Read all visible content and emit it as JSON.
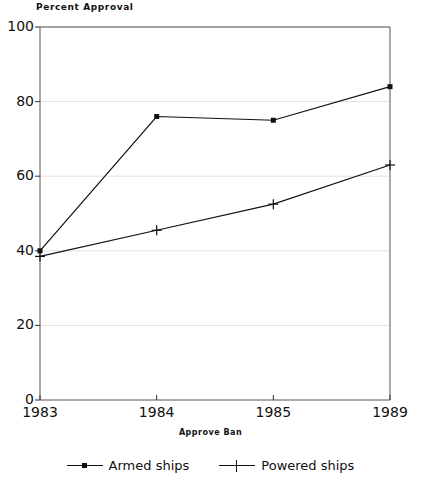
{
  "chart_data": {
    "type": "line",
    "title": "",
    "ylabel": "Percent Approval",
    "xlabel": "Approve Ban",
    "categories": [
      "1983",
      "1984",
      "1985",
      "1989"
    ],
    "ylim": [
      0,
      100
    ],
    "yticks": [
      0,
      20,
      40,
      60,
      80,
      100
    ],
    "ytick_labels": [
      "0",
      "20",
      "40",
      "60",
      "80",
      "100"
    ],
    "grid": true,
    "grid_axis": "y",
    "legend_position": "bottom",
    "series": [
      {
        "name": "Armed ships",
        "marker": "dot",
        "values": [
          40,
          76,
          75,
          84
        ]
      },
      {
        "name": "Powered ships",
        "marker": "plus",
        "values": [
          38.5,
          45.5,
          52.5,
          63
        ]
      }
    ]
  },
  "axis": {
    "y_title": "Percent Approval",
    "x_title": "Approve Ban"
  },
  "legend": {
    "entries": [
      {
        "label": "Armed ships",
        "marker": "dot-marker-icon"
      },
      {
        "label": "Powered ships",
        "marker": "plus-marker-icon"
      }
    ]
  }
}
